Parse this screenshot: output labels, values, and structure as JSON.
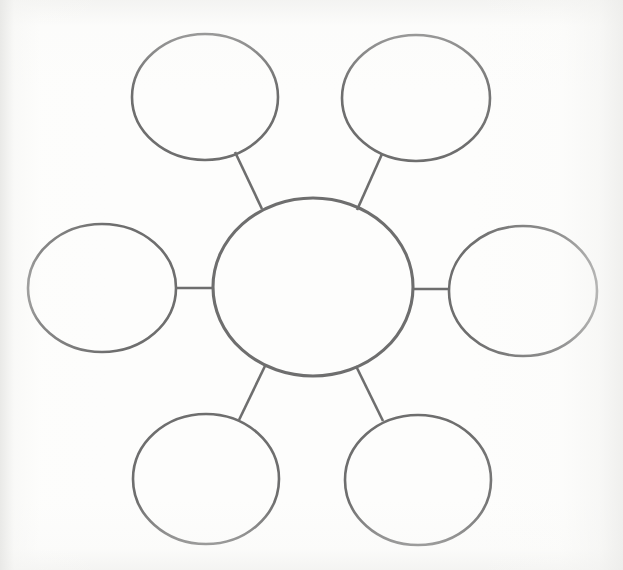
{
  "document": {
    "title": "Concept Map Worksheet",
    "kind": "blank-spider-diagram",
    "background_color": "#fdfdfc",
    "stroke_color": "#6e6e6e"
  },
  "diagram": {
    "type": "hub-and-spoke concept map",
    "center": {
      "id": "center-node",
      "label": "",
      "cx": 313,
      "cy": 287,
      "rx": 100,
      "ry": 89
    },
    "satellites": [
      {
        "id": "node-top-left",
        "label": "",
        "cx": 205,
        "cy": 97,
        "rx": 73,
        "ry": 63
      },
      {
        "id": "node-top-right",
        "label": "",
        "cx": 416,
        "cy": 98,
        "rx": 74,
        "ry": 63
      },
      {
        "id": "node-left",
        "label": "",
        "cx": 102,
        "cy": 288,
        "rx": 74,
        "ry": 64
      },
      {
        "id": "node-right",
        "label": "",
        "cx": 523,
        "cy": 291,
        "rx": 74,
        "ry": 65
      },
      {
        "id": "node-bottom-left",
        "label": "",
        "cx": 206,
        "cy": 479,
        "rx": 73,
        "ry": 65
      },
      {
        "id": "node-bottom-right",
        "label": "",
        "cx": 418,
        "cy": 480,
        "rx": 73,
        "ry": 65
      }
    ],
    "spokes": [
      {
        "id": "spoke-top-left",
        "from": "center-node",
        "to": "node-top-left",
        "x1": 262,
        "y1": 209,
        "x2": 235,
        "y2": 152
      },
      {
        "id": "spoke-top-right",
        "from": "center-node",
        "to": "node-top-right",
        "x1": 357,
        "y1": 210,
        "x2": 382,
        "y2": 154
      },
      {
        "id": "spoke-left",
        "from": "center-node",
        "to": "node-left",
        "x1": 213,
        "y1": 288,
        "x2": 176,
        "y2": 288
      },
      {
        "id": "spoke-right",
        "from": "center-node",
        "to": "node-right",
        "x1": 412,
        "y1": 289,
        "x2": 449,
        "y2": 289
      },
      {
        "id": "spoke-bottom-left",
        "from": "center-node",
        "to": "node-bottom-left",
        "x1": 265,
        "y1": 366,
        "x2": 239,
        "y2": 420
      },
      {
        "id": "spoke-bottom-right",
        "from": "center-node",
        "to": "node-bottom-right",
        "x1": 356,
        "y1": 366,
        "x2": 383,
        "y2": 421
      }
    ]
  }
}
